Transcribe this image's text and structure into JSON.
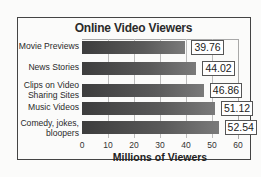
{
  "chart_data": {
    "type": "bar",
    "orientation": "horizontal",
    "title": "Online Video Viewers",
    "categories": [
      "Movie Previews",
      "News Stories",
      "Clips on Video Sharing Sites",
      "Music Videos",
      "Comedy, jokes, bloopers"
    ],
    "values": [
      39.76,
      44.02,
      46.86,
      51.12,
      52.54
    ],
    "data_labels": [
      "39.76",
      "44.02",
      "46.86",
      "51.12",
      "52.54"
    ],
    "xlabel": "Millions of Viewers",
    "ylabel": "",
    "xlim": [
      0,
      60
    ],
    "xticks": [
      "0",
      "10",
      "20",
      "30",
      "40",
      "50",
      "60"
    ],
    "grid": true,
    "legend": null
  },
  "labels": {
    "title": "Online Video Viewers",
    "xlabel": "Millions of Viewers",
    "cat0_line1": "Movie Previews",
    "cat1_line1": "News Stories",
    "cat2_line1": "Clips on Video",
    "cat2_line2": "Sharing Sites",
    "cat3_line1": "Music Videos",
    "cat4_line1": "Comedy, jokes,",
    "cat4_line2": "bloopers"
  }
}
